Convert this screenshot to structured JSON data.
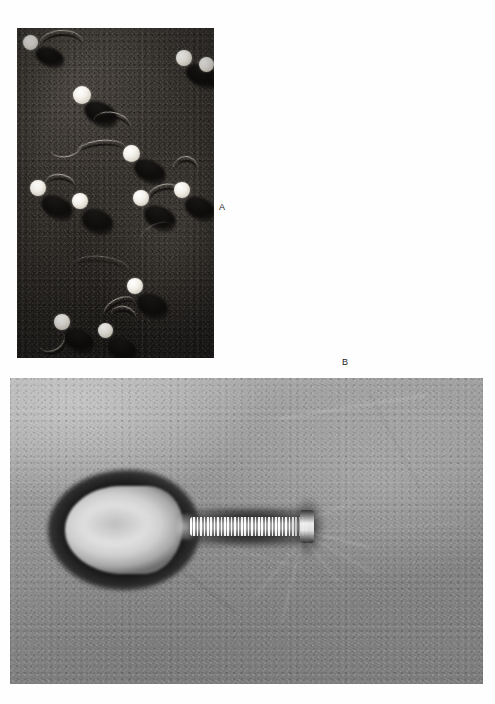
{
  "figure": {
    "kind": "electron-micrograph-figure",
    "background_color": "#fefefe",
    "panels": [
      {
        "id": "A",
        "label": "A",
        "technique": "metal-shadowed replica",
        "subject": "bacteriophage particles",
        "description": "Field of bacteriophage virions with bright round heads casting long dark shadows, with thin curved tail filaments",
        "frame": {
          "x": 17,
          "y": 28,
          "width": 197,
          "height": 330
        },
        "label_position": {
          "x": 219,
          "y": 203
        },
        "background_color": "#2f2c28",
        "head_color": "#f3f0e9",
        "shadow_color": "#0d0c0b",
        "particles": [
          {
            "head_x": 13,
            "head_y": 14,
            "head_d": 15,
            "shadow_angle": 34,
            "tail": "right-curve"
          },
          {
            "head_x": 166,
            "head_y": 29,
            "head_d": 16,
            "shadow_angle": 30,
            "tail": "up-curve"
          },
          {
            "head_x": 188,
            "head_y": 36,
            "head_d": 15,
            "shadow_angle": 30,
            "tail": "none"
          },
          {
            "head_x": 64,
            "head_y": 67,
            "head_d": 18,
            "shadow_angle": 36,
            "tail": "down-right-curve"
          },
          {
            "head_x": 113,
            "head_y": 125,
            "head_d": 17,
            "shadow_angle": 36,
            "tail": "left-wave"
          },
          {
            "head_x": 20,
            "head_y": 160,
            "head_d": 16,
            "shadow_angle": 38,
            "tail": "right-hook"
          },
          {
            "head_x": 62,
            "head_y": 173,
            "head_d": 16,
            "shadow_angle": 36,
            "tail": "none"
          },
          {
            "head_x": 123,
            "head_y": 170,
            "head_d": 16,
            "shadow_angle": 36,
            "tail": "right-curve"
          },
          {
            "head_x": 164,
            "head_y": 162,
            "head_d": 16,
            "shadow_angle": 36,
            "tail": "up-right-curve"
          },
          {
            "head_x": 117,
            "head_y": 258,
            "head_d": 16,
            "shadow_angle": 36,
            "tail": "down-left"
          },
          {
            "head_x": 44,
            "head_y": 293,
            "head_d": 16,
            "shadow_angle": 36,
            "tail": "left-loop"
          },
          {
            "head_x": 88,
            "head_y": 302,
            "head_d": 15,
            "shadow_angle": 36,
            "tail": "up-right"
          }
        ]
      },
      {
        "id": "B",
        "label": "B",
        "technique": "negative stain",
        "subject": "single bacteriophage virion",
        "description": "High magnification view of one tailed bacteriophage showing the elongated prolate head, the striated contractile tail sheath, the baseplate and faint tail fibers",
        "frame": {
          "x": 10,
          "y": 378,
          "width": 473,
          "height": 306
        },
        "label_position": {
          "x": 342,
          "y": 358
        },
        "background_color": "#8b8b8b",
        "stain_dark_color": "#1a1a1a",
        "capsid_color": "#e4e4e4",
        "structures": [
          {
            "name": "head",
            "label": "capsid",
            "x": 65,
            "y": 486,
            "width": 118,
            "height": 88
          },
          {
            "name": "neck",
            "label": "neck",
            "x": 176,
            "y": 514,
            "width": 20,
            "height": 26
          },
          {
            "name": "tail",
            "label": "contractile tail sheath",
            "x": 190,
            "y": 517,
            "width": 118,
            "height": 19,
            "striations": 34
          },
          {
            "name": "baseplate",
            "label": "baseplate",
            "x": 300,
            "y": 510,
            "width": 14,
            "height": 33
          },
          {
            "name": "fibers",
            "label": "tail fibers",
            "count": 5
          }
        ]
      }
    ]
  }
}
